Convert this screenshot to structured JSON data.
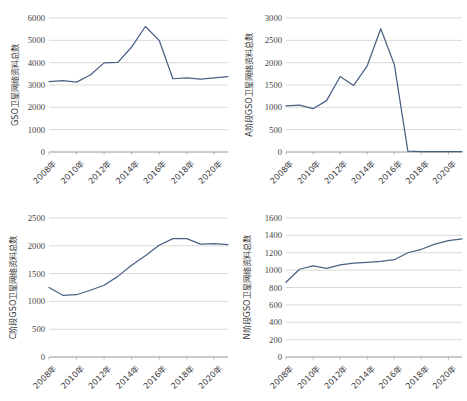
{
  "page": {
    "background": "#ffffff",
    "series_color": "#4a6184",
    "gridline_color": "#c8c8c8"
  },
  "chart_data": [
    {
      "id": "gso-total",
      "type": "line",
      "title": "",
      "ylabel": "GSO卫星网络资料总数",
      "xlabel": "",
      "ylim": [
        0,
        6000
      ],
      "ytick_values": [
        0,
        1000,
        2000,
        3000,
        4000,
        5000,
        6000
      ],
      "ytick_labels": [
        "0",
        "1000",
        "2000",
        "3000",
        "4000",
        "5000",
        "6000"
      ],
      "x": [
        2008,
        2009,
        2010,
        2011,
        2012,
        2013,
        2014,
        2015,
        2016,
        2017,
        2018,
        2019,
        2020,
        2021
      ],
      "xtick_labels": [
        "2008年",
        "2010年",
        "2012年",
        "2014年",
        "2016年",
        "2018年",
        "2020年"
      ],
      "values": [
        3150,
        3200,
        3130,
        3450,
        3990,
        4010,
        4700,
        5620,
        5000,
        3280,
        3320,
        3260,
        3320,
        3380
      ],
      "grid": true,
      "legend": "none"
    },
    {
      "id": "a-stage-gso-total",
      "type": "line",
      "title": "",
      "ylabel": "A阶段GSO卫星网络资料总数",
      "xlabel": "",
      "ylim": [
        0,
        3000
      ],
      "ytick_values": [
        0,
        500,
        1000,
        1500,
        2000,
        2500,
        3000
      ],
      "ytick_labels": [
        "0",
        "500",
        "1000",
        "1500",
        "2000",
        "2500",
        "3000"
      ],
      "x": [
        2008,
        2009,
        2010,
        2011,
        2012,
        2013,
        2014,
        2015,
        2016,
        2017,
        2018,
        2019,
        2020,
        2021
      ],
      "xtick_labels": [
        "2008年",
        "2010年",
        "2012年",
        "2014年",
        "2016年",
        "2018年",
        "2020年"
      ],
      "values": [
        1030,
        1050,
        970,
        1150,
        1690,
        1490,
        1930,
        2760,
        1960,
        20,
        10,
        10,
        10,
        10
      ],
      "grid": true,
      "legend": "none"
    },
    {
      "id": "c-stage-gso-total",
      "type": "line",
      "title": "",
      "ylabel": "C阶段GSO卫星网络资料总数",
      "xlabel": "",
      "ylim": [
        0,
        2500
      ],
      "ytick_values": [
        0,
        500,
        1000,
        1500,
        2000,
        2500
      ],
      "ytick_labels": [
        "0",
        "500",
        "1000",
        "1500",
        "2000",
        "2500"
      ],
      "x": [
        2008,
        2009,
        2010,
        2011,
        2012,
        2013,
        2014,
        2015,
        2016,
        2017,
        2018,
        2019,
        2020,
        2021
      ],
      "xtick_labels": [
        "2008年",
        "2010年",
        "2012年",
        "2014年",
        "2016年",
        "2018年",
        "2020年"
      ],
      "values": [
        1250,
        1110,
        1120,
        1200,
        1290,
        1450,
        1650,
        1820,
        2010,
        2130,
        2130,
        2030,
        2040,
        2020
      ],
      "grid": true,
      "legend": "none"
    },
    {
      "id": "n-stage-gso-total",
      "type": "line",
      "title": "",
      "ylabel": "N阶段GSO卫星网络资料总数",
      "xlabel": "",
      "ylim": [
        0,
        1600
      ],
      "ytick_values": [
        0,
        200,
        400,
        600,
        800,
        1000,
        1200,
        1400,
        1600
      ],
      "ytick_labels": [
        "0",
        "200",
        "400",
        "600",
        "800",
        "1000",
        "1200",
        "1400",
        "1600"
      ],
      "x": [
        2008,
        2009,
        2010,
        2011,
        2012,
        2013,
        2014,
        2015,
        2016,
        2017,
        2018,
        2019,
        2020,
        2021
      ],
      "xtick_labels": [
        "2008年",
        "2010年",
        "2012年",
        "2014年",
        "2016年",
        "2018年",
        "2020年"
      ],
      "values": [
        860,
        1010,
        1050,
        1020,
        1060,
        1080,
        1090,
        1100,
        1120,
        1200,
        1240,
        1300,
        1340,
        1360
      ],
      "grid": true,
      "legend": "none"
    }
  ]
}
